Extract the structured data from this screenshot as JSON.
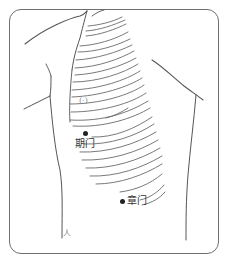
{
  "figure": {
    "type": "anatomical-acupoint-chart",
    "view": "lateral-chest",
    "frame_color": "#6f6f6f",
    "line_color": "#555555",
    "points": [
      {
        "id": "nipple",
        "label": "(·)",
        "x": 82,
        "y": 99
      },
      {
        "id": "qimen",
        "label": "期门",
        "x": 85,
        "y": 134
      },
      {
        "id": "zhangmen",
        "label": "章门",
        "x": 122,
        "y": 201
      }
    ],
    "corner_mark": "人"
  }
}
